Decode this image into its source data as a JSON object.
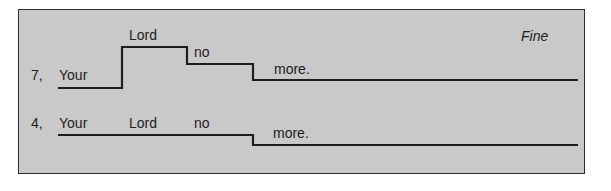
{
  "diagram": {
    "title_marker": "Fine",
    "colors": {
      "panel_bg": "#c9c9c9",
      "border": "#2e2e2e",
      "line": "#1e1e1e",
      "text": "#1e1e1e"
    },
    "rows": [
      {
        "label": "7,",
        "words": [
          "Your",
          "Lord",
          "no",
          "more."
        ],
        "contour_levels": [
          "low",
          "high",
          "mid",
          "mid-low"
        ]
      },
      {
        "label": "4,",
        "words": [
          "Your",
          "Lord",
          "no",
          "more."
        ],
        "contour_levels": [
          "mid",
          "mid",
          "mid",
          "low"
        ]
      }
    ]
  }
}
